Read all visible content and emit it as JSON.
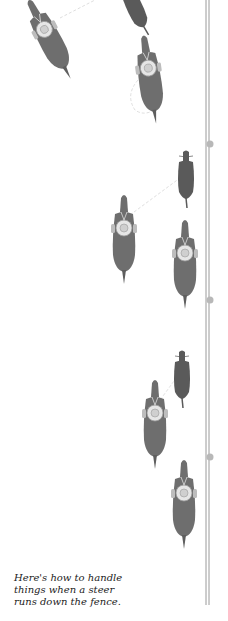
{
  "caption": {
    "lines": [
      "Here's how to handle",
      "things when a steer",
      "runs down the fence."
    ]
  },
  "colors": {
    "horse": "#6e6e6e",
    "steer": "#5a5a5a",
    "saddle": "#e6e6e6",
    "fence": "#9a9a9a",
    "fence_post": "#b8b8b8",
    "rope": "#d0d0d0",
    "caption_text": "#222222"
  },
  "diagram": {
    "fence": {
      "x": 207,
      "top": 0,
      "bottom": 605
    },
    "fence_posts_y": [
      144,
      300,
      457
    ],
    "figures": [
      {
        "type": "horse-rider",
        "x": 55,
        "y": 40,
        "angle": -30
      },
      {
        "type": "steer",
        "x": 135,
        "y": 10,
        "angle": -25
      },
      {
        "type": "horse-rider",
        "x": 150,
        "y": 78,
        "angle": -10
      },
      {
        "type": "steer",
        "x": 186,
        "y": 178,
        "angle": 0
      },
      {
        "type": "horse-rider",
        "x": 124,
        "y": 240,
        "angle": 0
      },
      {
        "type": "horse-rider",
        "x": 185,
        "y": 265,
        "angle": 0
      },
      {
        "type": "steer",
        "x": 182,
        "y": 380,
        "angle": 0
      },
      {
        "type": "horse-rider",
        "x": 155,
        "y": 425,
        "angle": 0
      },
      {
        "type": "horse-rider",
        "x": 184,
        "y": 505,
        "angle": 0
      }
    ]
  }
}
